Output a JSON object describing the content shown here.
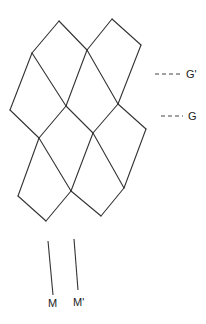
{
  "diagram": {
    "type": "quadrilateral-tiling",
    "stroke_color": "#333333",
    "vertices": {
      "a": [
        59,
        21
      ],
      "b": [
        112,
        19
      ],
      "c": [
        32,
        53
      ],
      "d": [
        87,
        50
      ],
      "e": [
        141,
        45
      ],
      "f": [
        10,
        110
      ],
      "g": [
        66,
        106
      ],
      "h": [
        118,
        104
      ],
      "i": [
        39,
        138
      ],
      "j": [
        93,
        133
      ],
      "k": [
        146,
        129
      ],
      "l": [
        18,
        196
      ],
      "m": [
        71,
        191
      ],
      "n": [
        124,
        188
      ],
      "o": [
        46,
        221
      ],
      "p": [
        101,
        216
      ]
    },
    "edges": [
      [
        "a",
        "c"
      ],
      [
        "a",
        "d"
      ],
      [
        "b",
        "d"
      ],
      [
        "b",
        "e"
      ],
      [
        "c",
        "f"
      ],
      [
        "c",
        "g"
      ],
      [
        "d",
        "g"
      ],
      [
        "d",
        "h"
      ],
      [
        "e",
        "h"
      ],
      [
        "f",
        "i"
      ],
      [
        "g",
        "i"
      ],
      [
        "g",
        "j"
      ],
      [
        "h",
        "j"
      ],
      [
        "h",
        "k"
      ],
      [
        "i",
        "l"
      ],
      [
        "i",
        "m"
      ],
      [
        "j",
        "m"
      ],
      [
        "j",
        "n"
      ],
      [
        "k",
        "n"
      ],
      [
        "l",
        "o"
      ],
      [
        "m",
        "o"
      ],
      [
        "m",
        "p"
      ],
      [
        "n",
        "p"
      ]
    ],
    "markers": [
      {
        "label": "G'",
        "x1": 155,
        "y1": 74,
        "x2": 183,
        "y2": 74,
        "style": "dashed"
      },
      {
        "label": "G",
        "x1": 161,
        "y1": 116,
        "x2": 183,
        "y2": 116,
        "style": "dashed"
      }
    ],
    "axes": [
      {
        "label": "M",
        "x1": 48,
        "y1": 241,
        "x2": 53,
        "y2": 295
      },
      {
        "label": "M'",
        "x1": 74,
        "y1": 239,
        "x2": 78,
        "y2": 290
      }
    ]
  },
  "labels": {
    "g_prime": "G'",
    "g": "G",
    "m": "M",
    "m_prime": "M'"
  }
}
